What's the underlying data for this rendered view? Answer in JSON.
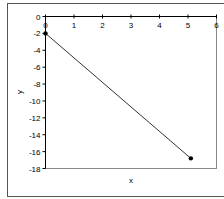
{
  "chart_data": {
    "type": "scatter",
    "title": "",
    "xlabel": "x",
    "ylabel": "y",
    "xlim": [
      0,
      6
    ],
    "ylim": [
      -18,
      0
    ],
    "x_ticks": [
      "0",
      "1",
      "2",
      "3",
      "4",
      "5",
      "6"
    ],
    "y_ticks": [
      "0",
      "-2",
      "-4",
      "-6",
      "-8",
      "-10",
      "-12",
      "-14",
      "-16",
      "-18"
    ],
    "grid": false,
    "legend": null,
    "series": [
      {
        "name": "series1",
        "mode": "lines+markers",
        "color": "#000000",
        "points": [
          {
            "x": 0,
            "y": -2
          },
          {
            "x": 5.1,
            "y": -16.8
          }
        ]
      }
    ]
  }
}
